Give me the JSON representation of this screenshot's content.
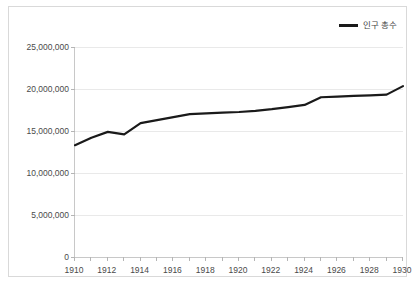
{
  "legend": {
    "position": "top-right",
    "entries": [
      {
        "label": "인구 총수",
        "color": "#1a1a1a",
        "icon": "line-swatch"
      }
    ]
  },
  "axes": {
    "y_ticks": [
      "0",
      "5,000,000",
      "10,000,000",
      "15,000,000",
      "20,000,000",
      "25,000,000"
    ],
    "x_ticks": [
      "1910",
      "1912",
      "1914",
      "1916",
      "1918",
      "1920",
      "1922",
      "1924",
      "1926",
      "1928",
      "1930"
    ]
  },
  "chart_data": {
    "type": "line",
    "title": "",
    "xlabel": "",
    "ylabel": "",
    "xlim": [
      1910,
      1930
    ],
    "ylim": [
      0,
      25000000
    ],
    "ytick_values": [
      0,
      5000000,
      10000000,
      15000000,
      20000000,
      25000000
    ],
    "ytick_labels": [
      "0",
      "5,000,000",
      "10,000,000",
      "15,000,000",
      "20,000,000",
      "25,000,000"
    ],
    "xtick_values": [
      1910,
      1912,
      1914,
      1916,
      1918,
      1920,
      1922,
      1924,
      1926,
      1928,
      1930
    ],
    "xtick_labels": [
      "1910",
      "1912",
      "1914",
      "1916",
      "1918",
      "1920",
      "1922",
      "1924",
      "1926",
      "1928",
      "1930"
    ],
    "x_minor_step": 1,
    "grid": {
      "horizontal": true,
      "vertical": false
    },
    "legend_position": "top-right",
    "x": [
      1910,
      1911,
      1912,
      1913,
      1914,
      1915,
      1916,
      1917,
      1918,
      1919,
      1920,
      1921,
      1922,
      1923,
      1924,
      1925,
      1926,
      1927,
      1928,
      1929,
      1930
    ],
    "series": [
      {
        "name": "인구 총수",
        "color": "#1a1a1a",
        "line_width": 2.2,
        "values": [
          13310000,
          14200000,
          14900000,
          14600000,
          15930000,
          16300000,
          16650000,
          17000000,
          17100000,
          17180000,
          17260000,
          17400000,
          17600000,
          17850000,
          18100000,
          19020000,
          19100000,
          19180000,
          19250000,
          19330000,
          20340000
        ]
      }
    ]
  }
}
